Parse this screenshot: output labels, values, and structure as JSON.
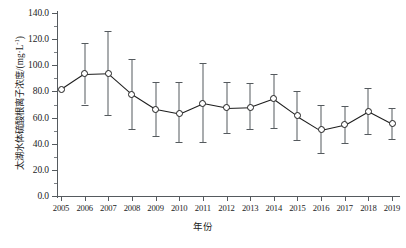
{
  "chart_data": {
    "type": "line",
    "title": "",
    "xlabel": "年份",
    "ylabel": "太湖水体硫酸根离子浓度/(mg·L⁻¹)",
    "ylabel_main": "太湖水体硫酸根离子浓度/(mg·L",
    "ylabel_sup": "-1",
    "ylabel_tail": ")",
    "xlim": [
      2005,
      2019
    ],
    "ylim": [
      0.0,
      140.0
    ],
    "y_major_step": 20.0,
    "y_minor_step": 10.0,
    "grid": false,
    "legend": "none",
    "marker": "open-circle",
    "error_bars": "vertical-with-caps",
    "categories": [
      "2005",
      "2006",
      "2007",
      "2008",
      "2009",
      "2010",
      "2011",
      "2012",
      "2013",
      "2014",
      "2015",
      "2016",
      "2017",
      "2018",
      "2019"
    ],
    "ytick_labels": [
      "0.0",
      "20.0",
      "40.0",
      "60.0",
      "80.0",
      "100.0",
      "120.0",
      "140.0"
    ],
    "ytick_values": [
      0.0,
      20.0,
      40.0,
      60.0,
      80.0,
      100.0,
      120.0,
      140.0
    ],
    "series": [
      {
        "name": "太湖水体硫酸根离子浓度",
        "values": [
          81.5,
          93.5,
          94.0,
          78.0,
          66.5,
          63.0,
          71.0,
          67.5,
          68.0,
          74.5,
          61.5,
          50.5,
          54.5,
          65.0,
          55.5
        ],
        "err_low": [
          null,
          70.0,
          62.0,
          51.5,
          46.0,
          41.0,
          41.0,
          48.0,
          51.0,
          52.0,
          42.5,
          33.0,
          40.5,
          47.5,
          43.5
        ],
        "err_high": [
          null,
          117.0,
          126.5,
          104.5,
          87.0,
          87.0,
          102.0,
          87.5,
          86.5,
          93.5,
          80.5,
          70.0,
          68.5,
          83.0,
          67.5
        ]
      }
    ],
    "colors": {
      "line": "#1c1c1c",
      "marker_face": "#ffffff",
      "marker_edge": "#1c1c1c",
      "error_bar": "#555a5e",
      "axis": "#555a5e",
      "text": "#1c1c1c",
      "background": "#ffffff"
    }
  }
}
